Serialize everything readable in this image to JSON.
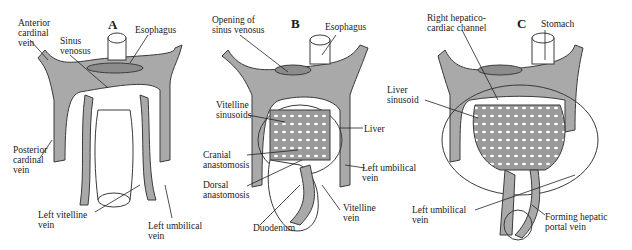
{
  "figure": {
    "colors": {
      "vein_fill": "#a9a9a9",
      "vein_stroke": "#3a3a3a",
      "background": "#ffffff",
      "line": "#222222"
    },
    "panels": [
      {
        "letter": "A",
        "labels": {
          "anterior_cardinal": "Anterior\ncardinal\nvein",
          "sinus_venosus": "Sinus\nvenosus",
          "esophagus": "Esophagus",
          "posterior_cardinal": "Posterior\ncardinal\nvein",
          "left_vitelline": "Left vitelline\nvein",
          "left_umbilical": "Left umbilical\nvein"
        }
      },
      {
        "letter": "B",
        "labels": {
          "opening_sinus": "Opening of\nsinus venosus",
          "esophagus": "Esophagus",
          "vitelline_sinusoids": "Vitelline\nsinusoids",
          "liver": "Liver",
          "cranial_anastomosis": "Cranial\nanastomosis",
          "dorsal_anastomosis": "Dorsal\nanastomosis",
          "left_umbilical": "Left umbilical\nvein",
          "vitelline_vein": "Vitelline\nvein",
          "duodenum": "Duodenum"
        }
      },
      {
        "letter": "C",
        "labels": {
          "right_hepatico": "Right hepatico-\ncardiac channel",
          "stomach": "Stomach",
          "liver_sinusoid": "Liver\nsinusoid",
          "left_umbilical": "Left umbilical\nvein",
          "forming_portal": "Forming hepatic\nportal vein"
        }
      }
    ]
  }
}
